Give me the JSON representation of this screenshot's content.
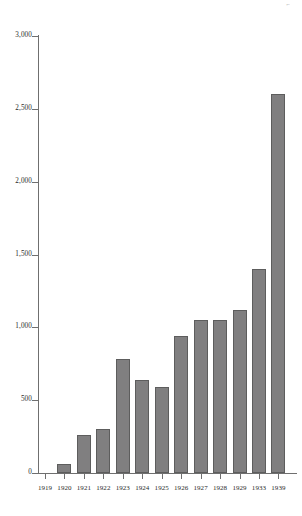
{
  "chart_data": {
    "type": "bar",
    "title": "",
    "subtitle": "",
    "xlabel": "",
    "ylabel": "",
    "categories": [
      "1919",
      "1920",
      "1921",
      "1922",
      "1923",
      "1924",
      "1925",
      "1926",
      "1927",
      "1928",
      "1929",
      "1933",
      "1939"
    ],
    "values": [
      0,
      60,
      260,
      300,
      780,
      640,
      590,
      940,
      1050,
      1050,
      1120,
      1400,
      2600
    ],
    "ylim": [
      0,
      3000
    ],
    "yticks": [
      0,
      500,
      1000,
      1500,
      2000,
      2500,
      3000
    ],
    "ytick_labels": [
      "0",
      "500",
      "1,000",
      "1,500",
      "2,000",
      "2,500",
      "3,000"
    ],
    "xtick_labels": [
      "1919",
      "1920",
      "1921",
      "1922",
      "1923",
      "1924",
      "1925",
      "1926",
      "1927",
      "1928",
      "1929",
      "1933",
      "1939"
    ],
    "grid": false,
    "legend": null,
    "legend_position": "none",
    "bar_color": "#807f80",
    "bar_edge_color": "#5d5d5d",
    "axis_color": "#6f6f6f"
  },
  "marks": {
    "corner_glyph": "⌐"
  }
}
